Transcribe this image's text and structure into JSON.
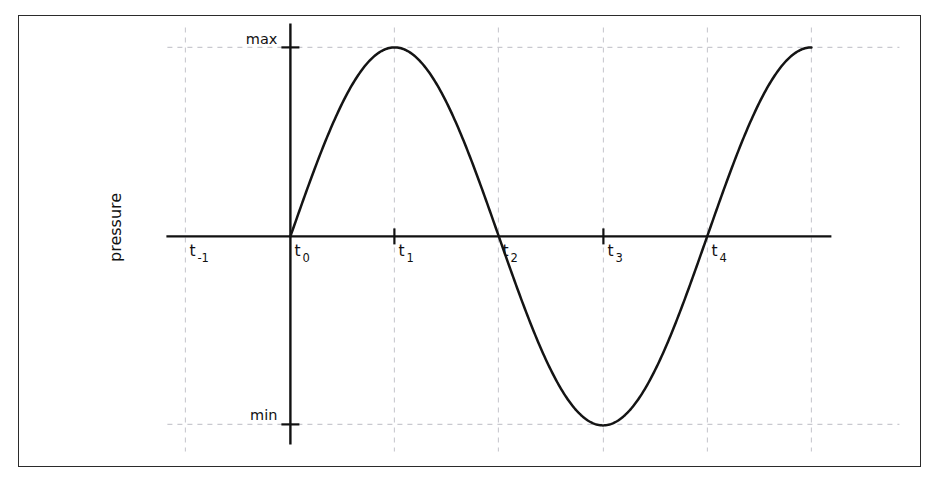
{
  "figure": {
    "background_color": "#ffffff",
    "frame_color": "#2b2b2b",
    "axis_color": "#111111",
    "curve_color": "#141414",
    "grid_color": "#c9c9cf"
  },
  "axes": {
    "y_axis_title": "pressure",
    "y_labels": {
      "max": "max",
      "min": "min"
    },
    "x_tick_labels": [
      {
        "base": "t",
        "sub": "-1",
        "x": 186,
        "has_tick": false
      },
      {
        "base": "t",
        "sub": "0",
        "x": 291,
        "has_tick": false
      },
      {
        "base": "t",
        "sub": "1",
        "x": 395,
        "has_tick": true
      },
      {
        "base": "t",
        "sub": "2",
        "x": 499,
        "has_tick": false
      },
      {
        "base": "t",
        "sub": "3",
        "x": 604,
        "has_tick": true
      },
      {
        "base": "t",
        "sub": "4",
        "x": 708,
        "has_tick": false
      }
    ]
  },
  "chart_data": {
    "type": "line",
    "title": "",
    "xlabel": "",
    "ylabel": "pressure",
    "grid": true,
    "legend": null,
    "x_tick_labels": [
      "t-1",
      "t0",
      "t1",
      "t2",
      "t3",
      "t4"
    ],
    "y_tick_labels": [
      "min",
      "max"
    ],
    "ylim": [
      "min",
      "max"
    ],
    "annotations": [
      "sine wave starting at zero at t0",
      "peak (max) at t1",
      "zero crossing descending at t2",
      "trough (min) at t3",
      "zero crossing ascending at t4"
    ],
    "series": [
      {
        "name": "pressure",
        "description": "one full sinusoidal cycle of pressure versus time",
        "amplitude": 1,
        "period_in_ticks": 4,
        "phase": 0,
        "x": [
          0,
          0.25,
          0.5,
          0.75,
          1,
          1.25,
          1.5,
          1.75,
          2,
          2.25,
          2.5,
          2.75,
          3,
          3.25,
          3.5,
          3.75,
          4,
          4.25,
          4.5,
          4.75,
          5
        ],
        "values": [
          0,
          0.383,
          0.707,
          0.924,
          1,
          0.924,
          0.707,
          0.383,
          0,
          -0.383,
          -0.707,
          -0.924,
          -1,
          -0.924,
          -0.707,
          -0.383,
          0,
          0.383,
          0.707,
          0.924,
          1
        ]
      }
    ]
  },
  "geometry": {
    "x_axis_y": 237,
    "y_axis_x": 291,
    "max_y": 48,
    "min_y": 425,
    "x_axis_start": 167,
    "x_axis_end": 832,
    "y_axis_top": 24,
    "y_axis_bottom": 445,
    "grid_x": [
      186,
      395,
      499,
      604,
      708,
      812
    ],
    "curve_start_x": 291,
    "curve_end_x": 812
  }
}
